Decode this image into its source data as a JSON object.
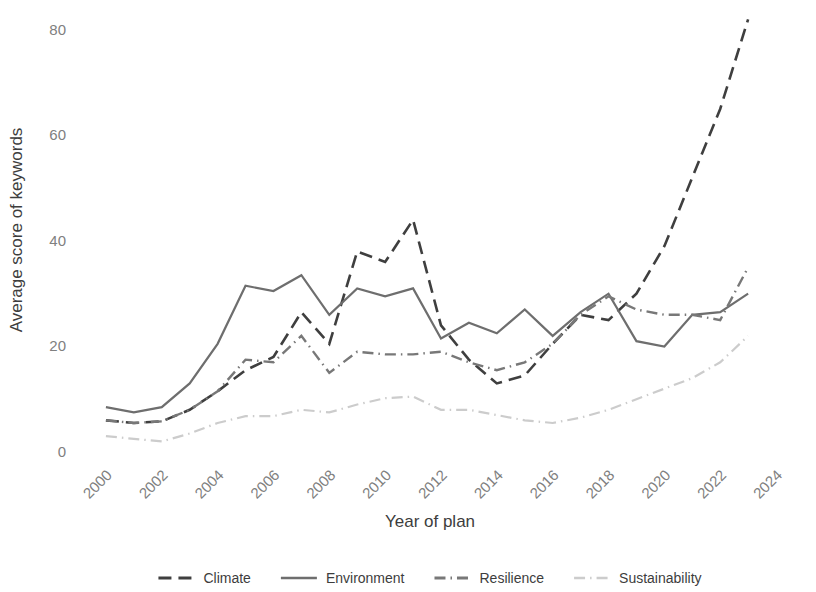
{
  "chart_data": {
    "type": "line",
    "title": "",
    "xlabel": "Year of plan",
    "ylabel": "Average score of keywords",
    "xlim": [
      1999,
      2024.5
    ],
    "ylim": [
      0,
      83
    ],
    "xticks": [
      2000,
      2002,
      2004,
      2006,
      2008,
      2010,
      2012,
      2014,
      2016,
      2018,
      2020,
      2022,
      2024
    ],
    "yticks": [
      0,
      20,
      40,
      60,
      80
    ],
    "xtick_labels": [
      "2000",
      "2002",
      "2004",
      "2006",
      "2008",
      "2010",
      "2012",
      "2014",
      "2016",
      "2018",
      "2020",
      "2022",
      "2024"
    ],
    "ytick_labels": [
      "0",
      "20",
      "40",
      "60",
      "80"
    ],
    "grid": false,
    "legend_position": "bottom",
    "x": [
      2000,
      2001,
      2002,
      2003,
      2004,
      2005,
      2006,
      2007,
      2008,
      2009,
      2010,
      2011,
      2012,
      2013,
      2014,
      2015,
      2016,
      2017,
      2018,
      2019,
      2020,
      2021,
      2022,
      2023
    ],
    "series": [
      {
        "name": "Climate",
        "color": "#3f3f3f",
        "width": 2.6,
        "dash": "13,7",
        "values": [
          6.0,
          5.5,
          5.8,
          8.0,
          11.5,
          15.5,
          18.0,
          26.5,
          20.5,
          38.0,
          36.0,
          44.0,
          24.0,
          17.5,
          13.0,
          14.5,
          20.5,
          26.0,
          25.0,
          30.0,
          39.0,
          52.0,
          65.0,
          82.0
        ]
      },
      {
        "name": "Environment",
        "color": "#6e6e6e",
        "width": 2.2,
        "dash": "",
        "values": [
          8.5,
          7.5,
          8.5,
          13.0,
          20.5,
          31.5,
          30.5,
          33.5,
          26.0,
          31.0,
          29.5,
          31.0,
          21.5,
          24.5,
          22.5,
          27.0,
          22.0,
          26.5,
          30.0,
          21.0,
          20.0,
          26.0,
          26.5,
          30.0
        ]
      },
      {
        "name": "Resilience",
        "color": "#787878",
        "width": 2.4,
        "dash": "11,5,1.5,5",
        "values": [
          6.0,
          5.5,
          5.8,
          8.0,
          11.5,
          17.5,
          17.0,
          22.0,
          15.0,
          19.0,
          18.5,
          18.5,
          19.0,
          17.0,
          15.5,
          17.0,
          20.5,
          26.0,
          29.5,
          27.0,
          26.0,
          26.0,
          25.0,
          35.0
        ]
      },
      {
        "name": "Sustainability",
        "color": "#cccccc",
        "width": 2.2,
        "dash": "11,5,1.5,5",
        "values": [
          3.0,
          2.5,
          2.0,
          3.5,
          5.5,
          6.8,
          6.8,
          8.0,
          7.5,
          9.0,
          10.2,
          10.5,
          8.0,
          8.0,
          7.0,
          6.0,
          5.5,
          6.5,
          8.0,
          10.0,
          12.0,
          14.0,
          17.0,
          22.0
        ]
      }
    ]
  },
  "legend": {
    "items": [
      {
        "label": "Climate"
      },
      {
        "label": "Environment"
      },
      {
        "label": "Resilience"
      },
      {
        "label": "Sustainability"
      }
    ]
  }
}
